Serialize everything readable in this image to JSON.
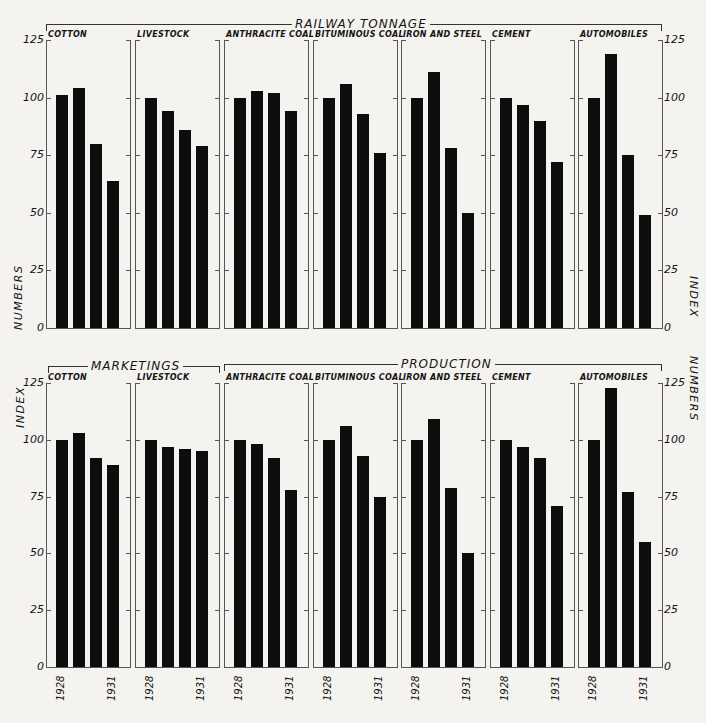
{
  "figure": {
    "top_group_label": "RAILWAY TONNAGE",
    "bottom_group_labels": [
      "MARKETINGS",
      "PRODUCTION"
    ],
    "left_axis_title_top": "NUMBERS",
    "left_axis_title_bottom": "INDEX",
    "right_axis_title_top": "INDEX",
    "right_axis_title_bottom": "NUMBERS",
    "y_ticks": [
      "125",
      "100",
      "75",
      "50",
      "25",
      "0"
    ],
    "year_labels": [
      "1928",
      "1931"
    ]
  },
  "chart_data": [
    {
      "type": "bar",
      "title": "RAILWAY TONNAGE",
      "ylabel": "INDEX NUMBERS",
      "ylim": [
        0,
        125
      ],
      "yticks": [
        0,
        25,
        50,
        75,
        100,
        125
      ],
      "categories": [
        "1928",
        "1929",
        "1930",
        "1931"
      ],
      "panels": [
        {
          "name": "COTTON",
          "values": [
            101,
            104,
            80,
            64
          ]
        },
        {
          "name": "LIVESTOCK",
          "values": [
            100,
            94,
            86,
            79
          ]
        },
        {
          "name": "ANTHRACITE COAL",
          "values": [
            100,
            103,
            102,
            94
          ]
        },
        {
          "name": "BITUMINOUS COAL",
          "values": [
            100,
            106,
            93,
            76
          ]
        },
        {
          "name": "IRON AND STEEL",
          "values": [
            100,
            111,
            78,
            50
          ]
        },
        {
          "name": "CEMENT",
          "values": [
            100,
            97,
            90,
            72
          ]
        },
        {
          "name": "AUTOMOBILES",
          "values": [
            100,
            119,
            75,
            49
          ]
        }
      ]
    },
    {
      "type": "bar",
      "title": "MARKETINGS / PRODUCTION",
      "ylabel": "INDEX NUMBERS",
      "ylim": [
        0,
        125
      ],
      "yticks": [
        0,
        25,
        50,
        75,
        100,
        125
      ],
      "categories": [
        "1928",
        "1929",
        "1930",
        "1931"
      ],
      "groups": [
        {
          "name": "MARKETINGS",
          "panels": [
            "COTTON",
            "LIVESTOCK"
          ]
        },
        {
          "name": "PRODUCTION",
          "panels": [
            "ANTHRACITE COAL",
            "BITUMINOUS COAL",
            "IRON AND STEEL",
            "CEMENT",
            "AUTOMOBILES"
          ]
        }
      ],
      "panels": [
        {
          "name": "COTTON",
          "values": [
            100,
            103,
            92,
            89
          ]
        },
        {
          "name": "LIVESTOCK",
          "values": [
            100,
            97,
            96,
            95
          ]
        },
        {
          "name": "ANTHRACITE COAL",
          "values": [
            100,
            98,
            92,
            78
          ]
        },
        {
          "name": "BITUMINOUS COAL",
          "values": [
            100,
            106,
            93,
            75
          ]
        },
        {
          "name": "IRON AND STEEL",
          "values": [
            100,
            109,
            79,
            50
          ]
        },
        {
          "name": "CEMENT",
          "values": [
            100,
            97,
            92,
            71
          ]
        },
        {
          "name": "AUTOMOBILES",
          "values": [
            100,
            123,
            77,
            55
          ]
        }
      ]
    }
  ]
}
